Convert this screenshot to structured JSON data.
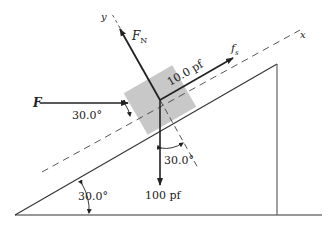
{
  "diagram": {
    "type": "free-body diagram on inclined plane",
    "colors": {
      "line": "#333333",
      "block": "#c8c8c8",
      "background": "#ffffff"
    },
    "axes": {
      "x_label": "x",
      "y_label": "y"
    },
    "forces": {
      "applied": {
        "symbol": "F"
      },
      "normal": {
        "symbol": "F",
        "subscript": "N"
      },
      "friction": {
        "symbol": "f",
        "subscript": "s",
        "value_label": "10.0 pf"
      },
      "weight": {
        "value_label": "100 pf"
      }
    },
    "angles": {
      "applied_to_incline": "30.0°",
      "weight_to_normal": "30.0°",
      "incline_angle": "30.0°"
    }
  }
}
